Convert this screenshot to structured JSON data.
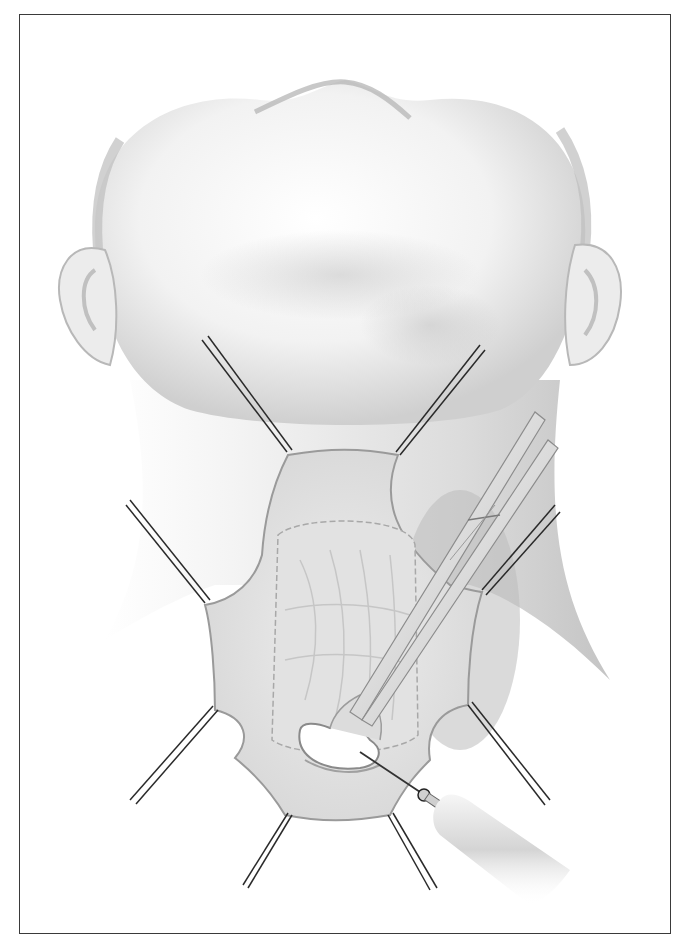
{
  "figure": {
    "colors": {
      "border": "#3a3a3a",
      "skin_light": "#f4f4f4",
      "skin_shade": "#c8c8c8",
      "tissue": "#e6e6e6",
      "tissue_edge": "#9a9a9a",
      "suture": "#2a2a2a",
      "instrument": "#d8d8d8"
    },
    "retraction_sutures": 8,
    "instruments": [
      "forceps",
      "electrocautery-needle"
    ]
  }
}
